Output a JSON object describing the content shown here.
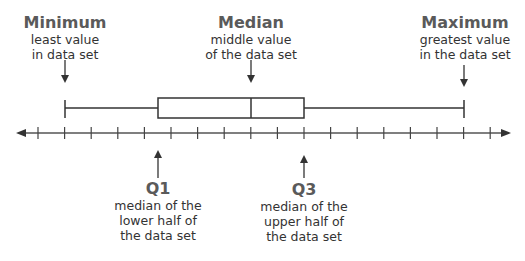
{
  "chart_data": {
    "type": "boxplot",
    "title": "",
    "axis": {
      "arrows": "both",
      "tick_count": 18,
      "tick_labels": []
    },
    "box": {
      "minimum_tick": 1,
      "q1_tick": 4.5,
      "median_tick": 8,
      "q3_tick": 10,
      "maximum_tick": 16
    },
    "annotations": [
      {
        "title": "Minimum",
        "lines": [
          "least value",
          "in data set"
        ],
        "position": "top"
      },
      {
        "title": "Median",
        "lines": [
          "middle value",
          "of the data set"
        ],
        "position": "top"
      },
      {
        "title": "Maximum",
        "lines": [
          "greatest value",
          "in the data set"
        ],
        "position": "top"
      },
      {
        "title": "Q1",
        "lines": [
          "median of the",
          "lower half of",
          "the data set"
        ],
        "position": "bottom"
      },
      {
        "title": "Q3",
        "lines": [
          "median of the",
          "upper half of",
          "the data set"
        ],
        "position": "bottom"
      }
    ]
  },
  "labels": {
    "minimum": {
      "title": "Minimum",
      "line1": "least value",
      "line2": "in data set"
    },
    "median": {
      "title": "Median",
      "line1": "middle value",
      "line2": "of the data set"
    },
    "maximum": {
      "title": "Maximum",
      "line1": "greatest value",
      "line2": "in the data set"
    },
    "q1": {
      "title": "Q1",
      "line1": "median of the",
      "line2": "lower half of",
      "line3": "the data set"
    },
    "q3": {
      "title": "Q3",
      "line1": "median of the",
      "line2": "upper half of",
      "line3": "the data set"
    }
  },
  "colors": {
    "line": "#333333",
    "title": "#5a5a5a",
    "text": "#333333",
    "background": "#ffffff"
  }
}
